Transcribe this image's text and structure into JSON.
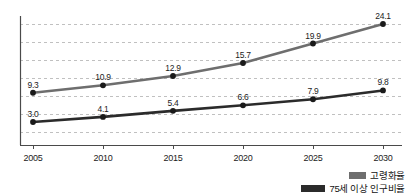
{
  "chart_data": {
    "type": "line",
    "title": "",
    "subtitle": "",
    "xlabel": "",
    "ylabel": "",
    "categories": [
      "2005",
      "2010",
      "2015",
      "2020",
      "2025",
      "2030"
    ],
    "x": [
      2005,
      2010,
      2015,
      2020,
      2025,
      2030
    ],
    "ylim": [
      0,
      27
    ],
    "grid": "horizontal-dashed",
    "legend_position": "bottom-right",
    "series": [
      {
        "name": "고령화율",
        "color": "#6e6e6e",
        "marker": "circle",
        "values": [
          9.3,
          10.9,
          12.9,
          15.7,
          19.9,
          24.1
        ],
        "labels": [
          "9.3",
          "10.9",
          "12.9",
          "15.7",
          "19.9",
          "24.1"
        ]
      },
      {
        "name": "75세 이상 인구비율",
        "color": "#2b2b2b",
        "marker": "circle",
        "values": [
          3.0,
          4.1,
          5.4,
          6.6,
          7.9,
          9.8
        ],
        "labels": [
          "3.0",
          "4.1",
          "5.4",
          "6.6",
          "7.9",
          "9.8"
        ]
      }
    ],
    "gridline_count": 7,
    "axis_color": "#4a4a4a",
    "gridline_color": "#b9b9b9"
  },
  "axis": {
    "x_tick_labels": [
      "2005",
      "2010",
      "2015",
      "2020",
      "2025",
      "2030"
    ]
  },
  "legend": {
    "items": [
      {
        "label": "고령화율",
        "color": "#6e6e6e"
      },
      {
        "label": "75세 이상 인구비율",
        "color": "#2b2b2b"
      }
    ]
  }
}
